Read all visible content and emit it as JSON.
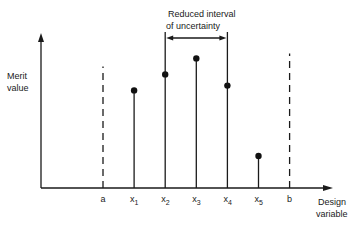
{
  "diagram": {
    "y_axis_label_line1": "Merit",
    "y_axis_label_line2": "value",
    "x_axis_label_line1": "Design",
    "x_axis_label_line2": "variable",
    "interval_label_line1": "Reduced interval",
    "interval_label_line2": "of uncertainty",
    "bounds": [
      {
        "id": "a",
        "label": "a",
        "position": 0,
        "style": "dashed",
        "height": 0.76
      },
      {
        "id": "b",
        "label": "b",
        "position": 6,
        "style": "dashed",
        "height": 0.84
      }
    ],
    "samples": [
      {
        "id": "x1",
        "base": "x",
        "sub": "1",
        "position": 1,
        "merit": 0.61
      },
      {
        "id": "x2",
        "base": "x",
        "sub": "2",
        "position": 2,
        "merit": 0.71
      },
      {
        "id": "x3",
        "base": "x",
        "sub": "3",
        "position": 3,
        "merit": 0.81
      },
      {
        "id": "x4",
        "base": "x",
        "sub": "4",
        "position": 4,
        "merit": 0.64
      },
      {
        "id": "x5",
        "base": "x",
        "sub": "5",
        "position": 5,
        "merit": 0.2
      }
    ],
    "interval_from": "x2",
    "interval_to": "x4"
  }
}
